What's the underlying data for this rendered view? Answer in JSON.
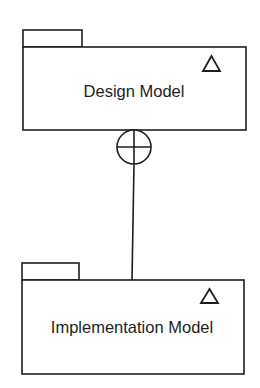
{
  "diagram": {
    "type": "UML package diagram",
    "packages": [
      {
        "name": "Design Model",
        "stereotype_icon": "triangle-icon"
      },
      {
        "name": "Implementation Model",
        "stereotype_icon": "triangle-icon"
      }
    ],
    "relationship": {
      "type": "containment",
      "from": "Design Model",
      "to": "Implementation Model",
      "end_icon": "circle-plus-icon"
    },
    "colors": {
      "stroke": "#1e1e1e",
      "background": "#ffffff"
    }
  }
}
